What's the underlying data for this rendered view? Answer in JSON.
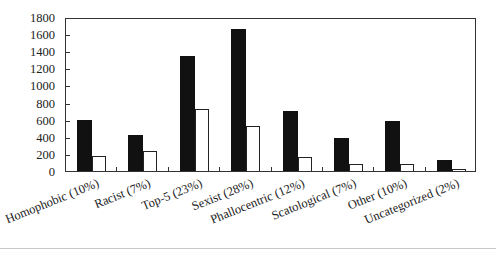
{
  "chart_data": {
    "type": "bar",
    "title": "",
    "xlabel": "",
    "ylabel": "",
    "ylim": [
      0,
      1800
    ],
    "yticks": [
      0,
      200,
      400,
      600,
      800,
      1000,
      1200,
      1400,
      1600,
      1800
    ],
    "grid": false,
    "legend": null,
    "categories": [
      "Homophobic (10%)",
      "Racist (7%)",
      "Top-5 (23%)",
      "Sexist (28%)",
      "Phallocentric (12%)",
      "Scatological (7%)",
      "Other (10%)",
      "Uncategorized (2%)"
    ],
    "series": [
      {
        "name": "Series 1 (black)",
        "color": "#111111",
        "values": [
          595,
          420,
          1340,
          1660,
          700,
          390,
          580,
          125
        ]
      },
      {
        "name": "Series 2 (white)",
        "color": "#ffffff",
        "values": [
          180,
          230,
          730,
          530,
          165,
          85,
          80,
          25
        ]
      }
    ]
  }
}
